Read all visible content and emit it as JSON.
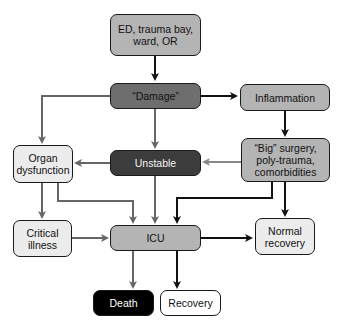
{
  "nodes": {
    "origin": "ED, trauma bay, ward, OR",
    "damage": "“Damage”",
    "inflammation": "Inflammation",
    "organ_dysfunction": "Organ dysfunction",
    "unstable": "Unstable",
    "big_surgery": "“Big” surgery, poly-trauma, comorbidities",
    "critical_illness": "Critical illness",
    "icu": "ICU",
    "normal_recovery": "Normal recovery",
    "death": "Death",
    "recovery": "Recovery"
  },
  "edges": [
    {
      "from": "origin",
      "to": "damage",
      "color": "#111111"
    },
    {
      "from": "damage",
      "to": "inflammation",
      "color": "#111111"
    },
    {
      "from": "damage",
      "to": "organ_dysfunction",
      "color": "#666666"
    },
    {
      "from": "damage",
      "to": "unstable",
      "color": "#666666"
    },
    {
      "from": "inflammation",
      "to": "big_surgery",
      "color": "#111111"
    },
    {
      "from": "big_surgery",
      "to": "unstable",
      "color": "#888888"
    },
    {
      "from": "unstable",
      "to": "organ_dysfunction",
      "color": "#666666"
    },
    {
      "from": "unstable",
      "to": "icu",
      "color": "#666666"
    },
    {
      "from": "organ_dysfunction",
      "to": "critical_illness",
      "color": "#666666"
    },
    {
      "from": "organ_dysfunction",
      "to": "icu",
      "color": "#666666"
    },
    {
      "from": "big_surgery",
      "to": "icu",
      "color": "#111111"
    },
    {
      "from": "big_surgery",
      "to": "normal_recovery",
      "color": "#111111"
    },
    {
      "from": "critical_illness",
      "to": "icu",
      "color": "#666666"
    },
    {
      "from": "icu",
      "to": "normal_recovery",
      "color": "#111111"
    },
    {
      "from": "icu",
      "to": "death",
      "color": "#666666"
    },
    {
      "from": "icu",
      "to": "recovery",
      "color": "#111111"
    }
  ]
}
